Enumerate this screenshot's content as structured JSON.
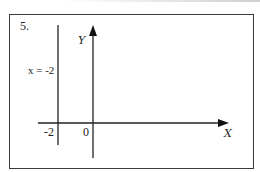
{
  "problem": {
    "number": "5."
  },
  "diagram": {
    "x_axis": {
      "label": "X"
    },
    "y_axis": {
      "label": "Y"
    },
    "vertical_line": {
      "label": "x = -2",
      "x_value": -2
    },
    "tick_labels": {
      "neg_two": "-2",
      "origin": "0"
    },
    "colors": {
      "line": "#222222",
      "frame": "#3a3a3a",
      "background": "#ffffff"
    }
  }
}
